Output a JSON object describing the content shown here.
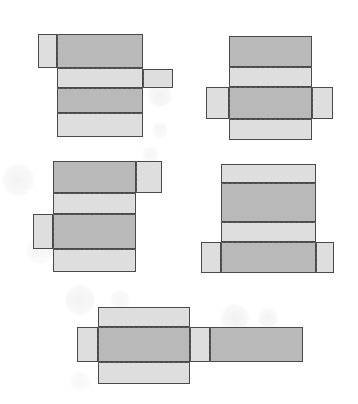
{
  "diagram": {
    "colors": {
      "dark_face": "#b9b9b9",
      "light_face": "#dedede",
      "outline": "#4a4a4a",
      "fold_line": "#5a5a5a",
      "background": "#ffffff"
    },
    "nets": [
      {
        "id": "net-1",
        "faces": [
          {
            "shade": "light",
            "x": 38,
            "y": 34,
            "w": 19,
            "h": 34
          },
          {
            "shade": "dark",
            "x": 57,
            "y": 34,
            "w": 86,
            "h": 34
          },
          {
            "shade": "light",
            "x": 57,
            "y": 68,
            "w": 86,
            "h": 20
          },
          {
            "shade": "light",
            "x": 143,
            "y": 69,
            "w": 30,
            "h": 19
          },
          {
            "shade": "dark",
            "x": 57,
            "y": 88,
            "w": 86,
            "h": 25
          },
          {
            "shade": "light",
            "x": 57,
            "y": 113,
            "w": 86,
            "h": 24
          }
        ],
        "folds_h": [
          {
            "x": 57,
            "y": 68,
            "w": 86
          },
          {
            "x": 57,
            "y": 88,
            "w": 86
          },
          {
            "x": 57,
            "y": 113,
            "w": 86
          }
        ],
        "folds_v": [
          {
            "x": 57,
            "y": 34,
            "h": 34
          },
          {
            "x": 143,
            "y": 69,
            "h": 19
          }
        ]
      },
      {
        "id": "net-2",
        "faces": [
          {
            "shade": "dark",
            "x": 229,
            "y": 36,
            "w": 83,
            "h": 31
          },
          {
            "shade": "light",
            "x": 229,
            "y": 67,
            "w": 83,
            "h": 20
          },
          {
            "shade": "light",
            "x": 206,
            "y": 87,
            "w": 23,
            "h": 32
          },
          {
            "shade": "dark",
            "x": 229,
            "y": 87,
            "w": 83,
            "h": 32
          },
          {
            "shade": "light",
            "x": 312,
            "y": 87,
            "w": 21,
            "h": 32
          },
          {
            "shade": "light",
            "x": 229,
            "y": 119,
            "w": 83,
            "h": 21
          }
        ],
        "folds_h": [
          {
            "x": 229,
            "y": 67,
            "w": 83
          },
          {
            "x": 229,
            "y": 87,
            "w": 83
          },
          {
            "x": 229,
            "y": 119,
            "w": 83
          }
        ],
        "folds_v": [
          {
            "x": 229,
            "y": 87,
            "h": 32
          },
          {
            "x": 312,
            "y": 87,
            "h": 32
          }
        ]
      },
      {
        "id": "net-3",
        "faces": [
          {
            "shade": "dark",
            "x": 53,
            "y": 161,
            "w": 83,
            "h": 32
          },
          {
            "shade": "light",
            "x": 136,
            "y": 161,
            "w": 26,
            "h": 32
          },
          {
            "shade": "light",
            "x": 53,
            "y": 193,
            "w": 83,
            "h": 21
          },
          {
            "shade": "light",
            "x": 33,
            "y": 214,
            "w": 20,
            "h": 35
          },
          {
            "shade": "dark",
            "x": 53,
            "y": 214,
            "w": 83,
            "h": 35
          },
          {
            "shade": "light",
            "x": 53,
            "y": 249,
            "w": 83,
            "h": 23
          }
        ],
        "folds_h": [
          {
            "x": 53,
            "y": 193,
            "w": 83
          },
          {
            "x": 53,
            "y": 214,
            "w": 83
          },
          {
            "x": 53,
            "y": 249,
            "w": 83
          }
        ],
        "folds_v": [
          {
            "x": 136,
            "y": 161,
            "h": 32
          },
          {
            "x": 53,
            "y": 214,
            "h": 35
          }
        ]
      },
      {
        "id": "net-4",
        "faces": [
          {
            "shade": "light",
            "x": 221,
            "y": 164,
            "w": 95,
            "h": 19
          },
          {
            "shade": "dark",
            "x": 221,
            "y": 183,
            "w": 95,
            "h": 39
          },
          {
            "shade": "light",
            "x": 221,
            "y": 222,
            "w": 95,
            "h": 20
          },
          {
            "shade": "light",
            "x": 201,
            "y": 242,
            "w": 20,
            "h": 31
          },
          {
            "shade": "dark",
            "x": 221,
            "y": 242,
            "w": 95,
            "h": 31
          },
          {
            "shade": "light",
            "x": 316,
            "y": 242,
            "w": 18,
            "h": 31
          }
        ],
        "folds_h": [
          {
            "x": 221,
            "y": 183,
            "w": 95
          },
          {
            "x": 221,
            "y": 222,
            "w": 95
          },
          {
            "x": 221,
            "y": 242,
            "w": 95
          }
        ],
        "folds_v": [
          {
            "x": 221,
            "y": 242,
            "h": 31
          },
          {
            "x": 316,
            "y": 242,
            "h": 31
          }
        ]
      },
      {
        "id": "net-5",
        "faces": [
          {
            "shade": "light",
            "x": 98,
            "y": 307,
            "w": 92,
            "h": 20
          },
          {
            "shade": "light",
            "x": 77,
            "y": 327,
            "w": 21,
            "h": 35
          },
          {
            "shade": "dark",
            "x": 98,
            "y": 327,
            "w": 92,
            "h": 35
          },
          {
            "shade": "light",
            "x": 190,
            "y": 327,
            "w": 20,
            "h": 35
          },
          {
            "shade": "dark",
            "x": 210,
            "y": 327,
            "w": 93,
            "h": 35
          },
          {
            "shade": "light",
            "x": 98,
            "y": 362,
            "w": 92,
            "h": 22
          }
        ],
        "folds_h": [
          {
            "x": 98,
            "y": 327,
            "w": 92
          },
          {
            "x": 98,
            "y": 362,
            "w": 92
          }
        ],
        "folds_v": [
          {
            "x": 98,
            "y": 327,
            "h": 35
          },
          {
            "x": 190,
            "y": 327,
            "h": 35
          },
          {
            "x": 210,
            "y": 327,
            "h": 35
          }
        ]
      }
    ],
    "decorations": [
      {
        "x": 160,
        "y": 95,
        "r": 12,
        "o": 0.1
      },
      {
        "x": 160,
        "y": 130,
        "r": 8,
        "o": 0.08
      },
      {
        "x": 18,
        "y": 180,
        "r": 16,
        "o": 0.09
      },
      {
        "x": 40,
        "y": 250,
        "r": 14,
        "o": 0.07
      },
      {
        "x": 290,
        "y": 105,
        "r": 14,
        "o": 0.07
      },
      {
        "x": 150,
        "y": 155,
        "r": 8,
        "o": 0.07
      },
      {
        "x": 80,
        "y": 300,
        "r": 15,
        "o": 0.09
      },
      {
        "x": 120,
        "y": 300,
        "r": 10,
        "o": 0.07
      },
      {
        "x": 235,
        "y": 318,
        "r": 14,
        "o": 0.1
      },
      {
        "x": 268,
        "y": 318,
        "r": 10,
        "o": 0.09
      },
      {
        "x": 80,
        "y": 382,
        "r": 10,
        "o": 0.06
      }
    ]
  }
}
